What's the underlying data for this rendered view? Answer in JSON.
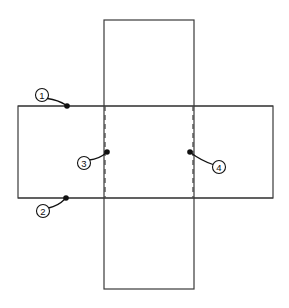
{
  "figure": {
    "background_color": "#ffffff",
    "width": 289,
    "height": 308
  },
  "style": {
    "solid_line_color": "#3a3a3a",
    "fold_line_color": "#4a4a4a",
    "callout_color": "#111111",
    "face_fill": "#ffffff"
  },
  "shapes": {
    "vertical_panel": {
      "name": "vertical-panel",
      "x": 104,
      "y": 20,
      "width": 90,
      "height": 269
    },
    "horizontal_panel": {
      "name": "horizontal-panel",
      "x": 18,
      "y": 106,
      "width": 255,
      "height": 92
    }
  },
  "fold_lines": [
    {
      "id": "fold-left",
      "x": 105,
      "y1": 106,
      "y2": 198
    },
    {
      "id": "fold-right",
      "x": 193,
      "y1": 106,
      "y2": 198
    }
  ],
  "callouts": [
    {
      "id": "callout-1",
      "label": "1",
      "circle_cx": 42,
      "circle_cy": 95,
      "circle_r": 6.5,
      "dot_x": 67,
      "dot_y": 106,
      "leader_path": "M 47.5 98.5 Q 58 100 66 105"
    },
    {
      "id": "callout-2",
      "label": "2",
      "circle_cx": 43,
      "circle_cy": 211,
      "circle_r": 6.5,
      "dot_x": 66,
      "dot_y": 198,
      "leader_path": "M 48.5 208 Q 58 206 65 199"
    },
    {
      "id": "callout-3",
      "label": "3",
      "circle_cx": 84,
      "circle_cy": 163,
      "circle_r": 6.5,
      "dot_x": 107,
      "dot_y": 152,
      "leader_path": "M 89.5 160 Q 99 159 106 153"
    },
    {
      "id": "callout-4",
      "label": "4",
      "circle_cx": 219,
      "circle_cy": 167,
      "circle_r": 6.5,
      "dot_x": 190,
      "dot_y": 152,
      "leader_path": "M 213 164.5 Q 202 161 191 153"
    }
  ]
}
